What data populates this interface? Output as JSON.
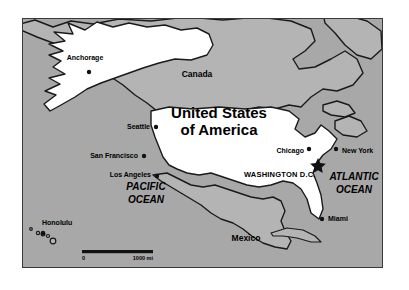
{
  "figure": {
    "name": "map-of-united-states-north-america",
    "frame": {
      "x": 22,
      "y": 18,
      "width": 361,
      "height": 250
    }
  },
  "colors": {
    "ocean": "#a8a8a8",
    "land_other": "#b4b4b4",
    "land_united_states": "#ffffff",
    "outline": "#1a1a1a",
    "text": "#000000",
    "frame_border": "#3a3a3a"
  },
  "title": {
    "line1": "United States",
    "line2": "of America"
  },
  "countries": [
    {
      "name": "canada",
      "label": "Canada",
      "x": 196,
      "y": 76,
      "anchor": "middle"
    },
    {
      "name": "mexico",
      "label": "Mexico",
      "x": 245,
      "y": 240,
      "anchor": "middle"
    }
  ],
  "oceans": [
    {
      "name": "pacific-ocean",
      "line1": "PACIFIC",
      "line2": "OCEAN",
      "x": 145,
      "y": 192
    },
    {
      "name": "atlantic-ocean",
      "line1": "ATLANTIC",
      "line2": "OCEAN",
      "x": 353,
      "y": 181
    }
  ],
  "capital": {
    "name": "washington-dc",
    "label": "WASHINGTON D.C.",
    "label_x": 243,
    "label_y": 175,
    "marker_x": 317,
    "marker_y": 163
  },
  "cities": [
    {
      "name": "anchorage",
      "label": "Anchorage",
      "label_x": 82,
      "label_y": 59,
      "anchor": "middle",
      "dot_x": 87,
      "dot_y": 71
    },
    {
      "name": "seattle",
      "label": "Seattle",
      "label_x": 148,
      "label_y": 127,
      "anchor": "end",
      "dot_x": 157,
      "dot_y": 126
    },
    {
      "name": "san-francisco",
      "label": "San Francisco",
      "label_x": 135,
      "label_y": 156,
      "anchor": "end",
      "dot_x": 140,
      "dot_y": 155
    },
    {
      "name": "los-angeles",
      "label": "Los Angeles",
      "label_x": 148,
      "label_y": 175,
      "anchor": "end",
      "dot_x": 153,
      "dot_y": 175
    },
    {
      "name": "chicago",
      "label": "Chicago",
      "label_x": 301,
      "label_y": 151,
      "anchor": "end",
      "dot_x": 306,
      "dot_y": 148
    },
    {
      "name": "new-york",
      "label": "New York",
      "label_x": 339,
      "label_y": 151,
      "anchor": "start",
      "dot_x": 332,
      "dot_y": 148
    },
    {
      "name": "miami",
      "label": "Miami",
      "label_x": 325,
      "label_y": 219,
      "anchor": "start",
      "dot_x": 319,
      "dot_y": 218
    },
    {
      "name": "honolulu",
      "label": "Honolulu",
      "label_x": 40,
      "label_y": 224,
      "anchor": "start",
      "dot_x": 42,
      "dot_y": 233
    }
  ],
  "scale_bar": {
    "name": "distance-scale",
    "start_label": "0",
    "end_label": "1000 mi",
    "bar_x": 81,
    "bar_y": 250,
    "bar_width": 71,
    "bar_height": 3.2,
    "start_label_x": 81,
    "end_label_x": 152,
    "label_y": 259
  },
  "geometry": {
    "canada_mainland": "M 0,8 L 14,4 L 30,10 L 44,3 L 60,7 L 72,1 L 96,2 L 120,0 L 150,2 L 186,0 L 230,3 L 262,1 L 290,6 L 300,20 L 296,34 L 282,40 L 272,52 L 284,60 L 300,56 L 316,50 L 330,44 L 344,52 L 352,66 L 346,80 L 330,88 L 316,86 L 302,94 L 292,104 L 278,100 L 262,104 L 244,102 L 226,106 L 206,104 L 186,108 L 166,106 L 150,110 L 138,104 L 128,96 L 116,90 L 104,80 L 92,74 L 80,62 L 70,48 L 56,40 L 42,36 L 28,28 L 14,22 L 2,16 Z",
    "alaska": "M 42,44 L 32,38 L 44,34 L 32,27 L 46,24 L 36,16 L 52,18 L 48,8 L 64,14 L 74,6 L 88,12 L 104,8 L 122,11 L 140,9 L 156,13 L 172,11 L 186,16 L 190,26 L 186,36 L 172,40 L 156,38 L 140,42 L 126,46 L 112,52 L 96,56 L 82,62 L 68,66 L 56,74 L 42,82 L 30,88 L 22,82 L 34,74 L 24,70 L 38,64 L 28,58 L 44,54 L 34,48 Z",
    "usa_mainland": "M 152,110 L 172,108 L 196,110 L 220,108 L 246,110 L 272,108 L 292,112 L 300,122 L 296,132 L 304,140 L 314,136 L 320,128 L 328,134 L 336,142 L 330,152 L 322,158 L 316,166 L 312,176 L 316,186 L 320,198 L 322,210 L 318,220 L 310,214 L 306,202 L 300,192 L 292,186 L 282,184 L 270,188 L 258,190 L 246,188 L 234,184 L 222,180 L 210,176 L 198,178 L 186,176 L 176,172 L 168,168 L 162,160 L 158,150 L 154,140 L 150,130 L 148,120 Z",
    "mexico_mainland": "M 156,178 L 168,176 L 180,182 L 192,188 L 204,190 L 216,188 L 228,192 L 240,196 L 252,200 L 264,202 L 274,200 L 282,204 L 286,214 L 282,224 L 286,234 L 292,244 L 288,252 L 276,250 L 264,246 L 254,240 L 244,232 L 234,226 L 222,222 L 212,216 L 202,208 L 192,202 L 182,196 L 174,190 L 166,186 Z",
    "cuba": "M 268,236 L 284,232 L 300,234 L 312,240 L 318,246 L 308,246 L 294,242 L 280,240 L 270,240 Z",
    "greenland_edge": "M 320,0 L 340,2 L 356,10 L 362,24 L 358,36 L 348,42 L 336,36 L 330,24 L 326,12 Z",
    "nova_scotia": "M 330,118 L 344,114 L 352,120 L 346,128 L 334,128 Z",
    "great_lakes_hint": "M 276,104 L 290,102 L 298,108 L 292,116 L 280,114 Z",
    "hawaii_islands": [
      {
        "cx": 29,
        "cy": 232,
        "r": 1.4
      },
      {
        "cx": 36,
        "cy": 236,
        "r": 1.6
      },
      {
        "cx": 41,
        "cy": 237,
        "r": 1.8
      },
      {
        "cx": 46,
        "cy": 239,
        "r": 1.5
      },
      {
        "cx": 51,
        "cy": 243,
        "r": 2.6
      }
    ]
  },
  "icons": {
    "capital_star": "star-icon",
    "city_marker": "dot-icon",
    "scale": "scale-bar-icon"
  }
}
